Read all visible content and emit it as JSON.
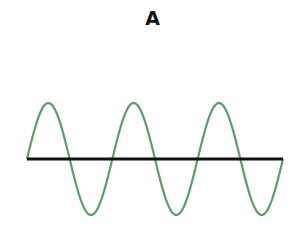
{
  "figure": {
    "label": "A",
    "colors": {
      "wave": "#5b9e6b",
      "axis": "#111111",
      "background": "#ffffff"
    },
    "wave": {
      "type": "sine",
      "cycles": 3,
      "x_start": 27,
      "x_end": 283,
      "baseline_y": 159,
      "amplitude": 56,
      "phase": "starts at zero, rises first, ends at zero"
    }
  }
}
